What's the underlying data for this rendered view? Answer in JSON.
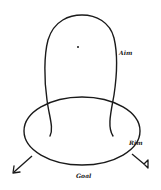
{
  "diagram": {
    "labels": {
      "aim": "Aim",
      "rim": "Rim",
      "goal": "Goal"
    },
    "elements": [
      {
        "name": "aim-loop",
        "type": "open-loop-curve"
      },
      {
        "name": "rim-ellipse",
        "type": "ellipse"
      },
      {
        "name": "center-dot",
        "type": "point"
      },
      {
        "name": "exit-arrow",
        "type": "arrow",
        "direction": "down-left"
      },
      {
        "name": "rim-triangle-marker",
        "type": "triangle-end-line"
      }
    ],
    "colors": {
      "stroke": "#1a1a1a",
      "background": "#ffffff"
    }
  }
}
